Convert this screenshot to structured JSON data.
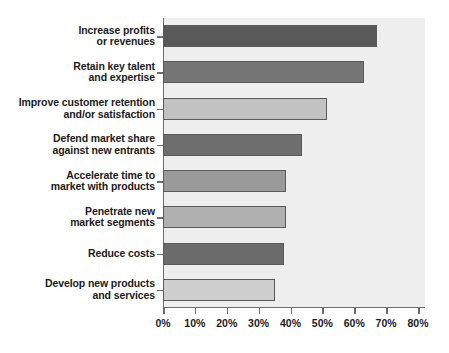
{
  "chart_data": {
    "type": "bar",
    "orientation": "horizontal",
    "title": "",
    "subtitle": "",
    "xlabel": "",
    "ylabel": "",
    "xlim": [
      0,
      80
    ],
    "ylim": null,
    "grid": false,
    "legend": null,
    "legend_position": "none",
    "value_suffix": "%",
    "categories": [
      "Increase profits or revenues",
      "Retain key talent and expertise",
      "Improve customer retention and/or satisfaction",
      "Defend market share against new entrants",
      "Accelerate time to market with products",
      "Penetrate new market segments",
      "Reduce costs",
      "Develop new products and services"
    ],
    "category_lines": [
      [
        "Increase profits",
        "or revenues"
      ],
      [
        "Retain key talent",
        "and expertise"
      ],
      [
        "Improve customer retention",
        "and/or satisfaction"
      ],
      [
        "Defend market share",
        "against new entrants"
      ],
      [
        "Accelerate time to",
        "market with products"
      ],
      [
        "Penetrate new",
        "market segments"
      ],
      [
        "Reduce costs"
      ],
      [
        "Develop new products",
        "and services"
      ]
    ],
    "values": [
      67,
      63,
      51.5,
      43.5,
      38.5,
      38.5,
      38,
      35
    ],
    "bar_colors": [
      "#595959",
      "#757575",
      "#c2c2c2",
      "#6e6e6e",
      "#9a9a9a",
      "#b0b0b0",
      "#6b6b6b",
      "#cfcfcf"
    ],
    "bar_border_color": "#5a5a5a",
    "xticks": [
      0,
      10,
      20,
      30,
      40,
      50,
      60,
      70,
      80
    ],
    "xtick_labels": [
      "0%",
      "10%",
      "20%",
      "30%",
      "40%",
      "50%",
      "60%",
      "70%",
      "80%"
    ],
    "plot_background": "#eeeeee",
    "axis_color": "#6d6d6d",
    "text_color": "#1b1b1b"
  }
}
